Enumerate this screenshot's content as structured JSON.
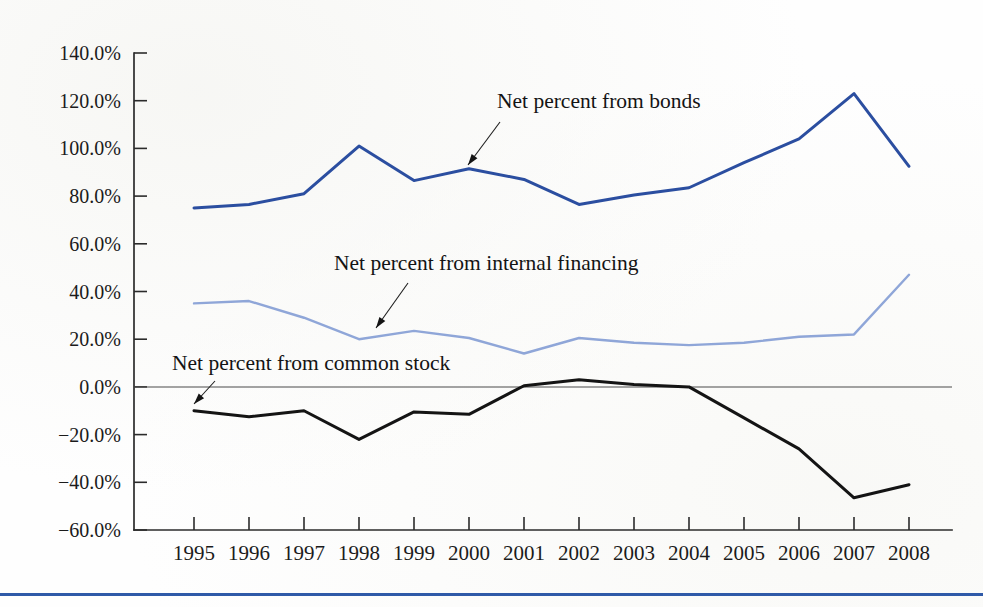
{
  "chart_data": {
    "type": "line",
    "title": "",
    "xlabel": "",
    "ylabel": "",
    "grid": false,
    "legend_position": "inline-annotations",
    "categories": [
      "1995",
      "1996",
      "1997",
      "1998",
      "1999",
      "2000",
      "2001",
      "2002",
      "2003",
      "2004",
      "2005",
      "2006",
      "2007",
      "2008"
    ],
    "x": [
      1995,
      1996,
      1997,
      1998,
      1999,
      2000,
      2001,
      2002,
      2003,
      2004,
      2005,
      2006,
      2007,
      2008
    ],
    "ylim": [
      -60,
      140
    ],
    "ytick_values": [
      140,
      120,
      100,
      80,
      60,
      40,
      20,
      0,
      -20,
      -40,
      -60
    ],
    "ytick_labels": [
      "140.0%",
      "120.0%",
      "100.0%",
      "80.0%",
      "60.0%",
      "40.0%",
      "20.0%",
      "0.0%",
      "−20.0%",
      "−40.0%",
      "−60.0%"
    ],
    "xtick_labels": [
      "1995",
      "1996",
      "1997",
      "1998",
      "1999",
      "2000",
      "2001",
      "2002",
      "2003",
      "2004",
      "2005",
      "2006",
      "2007",
      "2008"
    ],
    "series": [
      {
        "name": "Net percent from bonds",
        "color": "#2b4ea0",
        "width": 3.0,
        "values": [
          75.0,
          76.5,
          81.0,
          101.0,
          86.5,
          91.5,
          87.0,
          76.5,
          80.5,
          83.5,
          94.0,
          104.0,
          123.0,
          92.5
        ]
      },
      {
        "name": "Net percent from internal financing",
        "color": "#8fa6d8",
        "width": 2.4,
        "values": [
          35.0,
          36.0,
          29.0,
          20.0,
          23.5,
          20.5,
          14.0,
          20.5,
          18.5,
          17.5,
          18.5,
          21.0,
          22.0,
          47.0
        ]
      },
      {
        "name": "Net percent from common stock",
        "color": "#141414",
        "width": 3.0,
        "values": [
          -10.0,
          -12.5,
          -10.0,
          -22.0,
          -10.5,
          -11.5,
          0.5,
          3.0,
          1.0,
          0.0,
          -13.0,
          -26.0,
          -46.5,
          -41.0
        ]
      }
    ],
    "annotations": [
      {
        "label": "Net percent from bonds",
        "series": "Net percent from bonds",
        "text_x": 497,
        "text_y": 108,
        "arrow_from_x": 500,
        "arrow_from_y": 122,
        "arrow_to_x": 468,
        "arrow_to_y": 165
      },
      {
        "label": "Net percent from internal financing",
        "series": "Net percent from internal financing",
        "text_x": 334,
        "text_y": 270,
        "arrow_from_x": 408,
        "arrow_from_y": 283,
        "arrow_to_x": 376,
        "arrow_to_y": 328
      },
      {
        "label": "Net percent from common stock",
        "series": "Net percent from common stock",
        "text_x": 172,
        "text_y": 370,
        "arrow_from_x": 215,
        "arrow_from_y": 381,
        "arrow_to_x": 194,
        "arrow_to_y": 404
      }
    ]
  },
  "accent_color": "#2f5aa8",
  "footer": {
    "rule_color": "#2f5aa8"
  }
}
